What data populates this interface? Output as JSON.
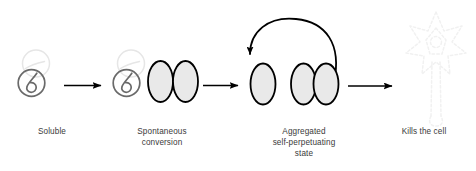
{
  "figure": {
    "background_color": "#ffffff",
    "width": 476,
    "height": 171
  },
  "colors": {
    "text": "#3a3a3a",
    "arrow": "#000000",
    "ellipse_fill": "#e8e8e8",
    "ellipse_stroke": "#000000",
    "soluble_stroke": "#666666",
    "ghost_stroke": "#e4e4e4",
    "neuron_stroke": "#f2f2f2"
  },
  "stages": [
    {
      "id": "soluble",
      "label": "Soluble",
      "icon": "soluble-prion-spiral",
      "description": "Gray circular prion with inner spiral plus faint ghost circle"
    },
    {
      "id": "spontaneous-conversion",
      "label": "Spontaneous\nconversion",
      "icon": "converting-prion-pair",
      "description": "Soluble prion next to two fused shaded ellipses"
    },
    {
      "id": "aggregated-self-perpetuating-state",
      "label": "Aggregated\nself-perpetuating\nstate",
      "icon": "aggregated-ellipses",
      "description": "One single ellipse and a pair of fused ellipses with recycling loop arrow"
    },
    {
      "id": "kills-the-cell",
      "label": "Kills the cell",
      "icon": "neuron-outline",
      "description": "Faint dashed star-shaped neuron with long axon"
    }
  ],
  "arrows": [
    {
      "id": "arrow-1",
      "from": "soluble",
      "to": "spontaneous-conversion",
      "type": "straight"
    },
    {
      "id": "arrow-2",
      "from": "spontaneous-conversion",
      "to": "aggregated-self-perpetuating-state",
      "type": "straight"
    },
    {
      "id": "arrow-3",
      "from": "aggregated-self-perpetuating-state",
      "to": "kills-the-cell",
      "type": "straight"
    },
    {
      "id": "arrow-loop",
      "from": "aggregated-self-perpetuating-state",
      "to": "aggregated-self-perpetuating-state",
      "type": "curved-recycle"
    }
  ]
}
